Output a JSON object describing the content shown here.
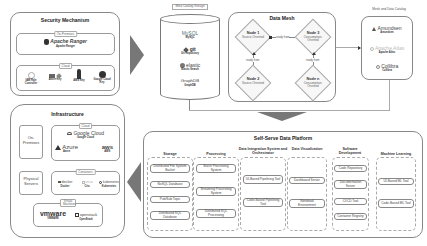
{
  "security": {
    "title": "Security Mechanism",
    "on_premises_label": "On-Premises",
    "ranger": {
      "logo": "Apache Ranger",
      "caption": "Apache Ranger"
    },
    "cloud_label": "Cloud",
    "cloud_items": [
      {
        "icon": "iam-icon",
        "caption": "IAM Role Controller"
      },
      {
        "icon": "vault-icon",
        "caption": "Azure Key"
      },
      {
        "icon": "key-icon",
        "caption": "AWS Key"
      },
      {
        "icon": "gcp-key-icon",
        "caption": "Google Cloud Key"
      }
    ]
  },
  "metadata_storage": {
    "title": "Meta Catalog Storage",
    "items": [
      {
        "logo": "MySQL",
        "caption": "MySQL"
      },
      {
        "logo": "git",
        "caption": "Git Repository"
      },
      {
        "logo": "elastic",
        "caption": "Elastic Search"
      },
      {
        "logo": "GraphDB",
        "caption": "GraphDB"
      }
    ]
  },
  "data_mesh": {
    "title": "Data Mesh",
    "nodes": [
      {
        "name": "Node 1",
        "type": "Source-Oriented"
      },
      {
        "name": "Node 3",
        "type": "Consumption-Oriented"
      },
      {
        "name": "Node 2",
        "type": "Source-Oriented"
      },
      {
        "name": "Node n",
        "type": "Consumption-Oriented"
      }
    ],
    "edge_label": "ready from"
  },
  "mesh_catalog": {
    "title": "Mesh and Data Catalog",
    "items": [
      {
        "logo": "Amundsen",
        "caption": "Amundsen"
      },
      {
        "logo": "Apache Atlas",
        "caption": "Apache Atlas"
      },
      {
        "logo": "Collibra",
        "caption": "Collibra"
      }
    ]
  },
  "infrastructure": {
    "title": "Infrastructure",
    "on_premises": "On-Premises",
    "physical_servers": "Physical Servers",
    "cloud_label": "Cloud",
    "cloud": [
      {
        "logo": "Google Cloud",
        "caption": "Google Cloud"
      },
      {
        "logo": "Azure",
        "caption": "Azure"
      },
      {
        "logo": "aws",
        "caption": "AWS"
      }
    ],
    "containers_label": "Containers",
    "containers": [
      {
        "logo": "docker",
        "caption": "Docker"
      },
      {
        "logo": "cri-o",
        "caption": "Crio"
      },
      {
        "logo": "kubernetes",
        "caption": "Kubernetes"
      }
    ],
    "vm_label": "Virtual Machines",
    "vms": [
      {
        "logo": "vmware",
        "caption": "VMWARE"
      },
      {
        "logo": "openstack",
        "caption": "OpenStack"
      }
    ]
  },
  "platform": {
    "title": "Self-Serve Data Platform",
    "columns": [
      {
        "title": "Storage",
        "items": [
          "Distributed File System Bucket",
          "NoSQL Database",
          "Pub/Sub Topic",
          "Distributed SQL Database"
        ]
      },
      {
        "title": "Processing",
        "items": [
          "Batch Processing System",
          "Streaming Processing System",
          "Distributed SQL Processing"
        ]
      },
      {
        "title": "Data Integration System and Orchestrator",
        "items": [
          "UI-Based Pipelining Tool",
          "Code-Based Pipelining Tool"
        ]
      },
      {
        "title": "Data Visualization",
        "items": [
          "Dashboard Server",
          "Notebook Environment"
        ]
      },
      {
        "title": "Software Development",
        "items": [
          "Code Repository",
          "Documentation Server",
          "CI/CD Tool",
          "Container Registry"
        ]
      },
      {
        "title": "Machine Learning",
        "items": [
          "UI-Based ML Tool",
          "Code-Based ML Tool"
        ]
      }
    ]
  }
}
